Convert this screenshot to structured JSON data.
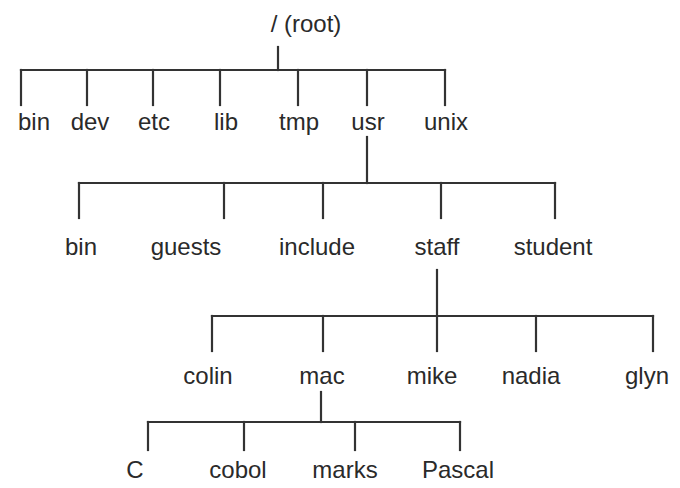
{
  "colors": {
    "line": "#333333",
    "text": "#2a2a2a",
    "background": "#ffffff"
  },
  "nodes": {
    "root": {
      "label": "/ (root)",
      "x": 306,
      "y": 24
    },
    "bin1": {
      "label": "bin",
      "x": 34,
      "y": 122
    },
    "dev": {
      "label": "dev",
      "x": 90,
      "y": 122
    },
    "etc": {
      "label": "etc",
      "x": 154,
      "y": 122
    },
    "lib": {
      "label": "lib",
      "x": 226,
      "y": 122
    },
    "tmp": {
      "label": "tmp",
      "x": 299,
      "y": 122
    },
    "usr": {
      "label": "usr",
      "x": 368,
      "y": 122
    },
    "unix": {
      "label": "unix",
      "x": 446,
      "y": 122
    },
    "bin2": {
      "label": "bin",
      "x": 81,
      "y": 247
    },
    "guests": {
      "label": "guests",
      "x": 186,
      "y": 247
    },
    "include": {
      "label": "include",
      "x": 317,
      "y": 247
    },
    "staff": {
      "label": "staff",
      "x": 437,
      "y": 247
    },
    "student": {
      "label": "student",
      "x": 553,
      "y": 247
    },
    "colin": {
      "label": "colin",
      "x": 208,
      "y": 376
    },
    "mac": {
      "label": "mac",
      "x": 322,
      "y": 376
    },
    "mike": {
      "label": "mike",
      "x": 432,
      "y": 376
    },
    "nadia": {
      "label": "nadia",
      "x": 531,
      "y": 376
    },
    "glyn": {
      "label": "glyn",
      "x": 647,
      "y": 376
    },
    "C": {
      "label": "C",
      "x": 135,
      "y": 470
    },
    "cobol": {
      "label": "cobol",
      "x": 238,
      "y": 470
    },
    "marks": {
      "label": "marks",
      "x": 345,
      "y": 470
    },
    "Pascal": {
      "label": "Pascal",
      "x": 458,
      "y": 470
    }
  },
  "edges": [
    {
      "parent": "root",
      "children": [
        "bin1",
        "dev",
        "etc",
        "lib",
        "tmp",
        "usr",
        "unix"
      ]
    },
    {
      "parent": "usr",
      "children": [
        "bin2",
        "guests",
        "include",
        "staff",
        "student"
      ]
    },
    {
      "parent": "staff",
      "children": [
        "colin",
        "mac",
        "mike",
        "nadia",
        "glyn"
      ]
    },
    {
      "parent": "mac",
      "children": [
        "C",
        "cobol",
        "marks",
        "Pascal"
      ]
    }
  ]
}
